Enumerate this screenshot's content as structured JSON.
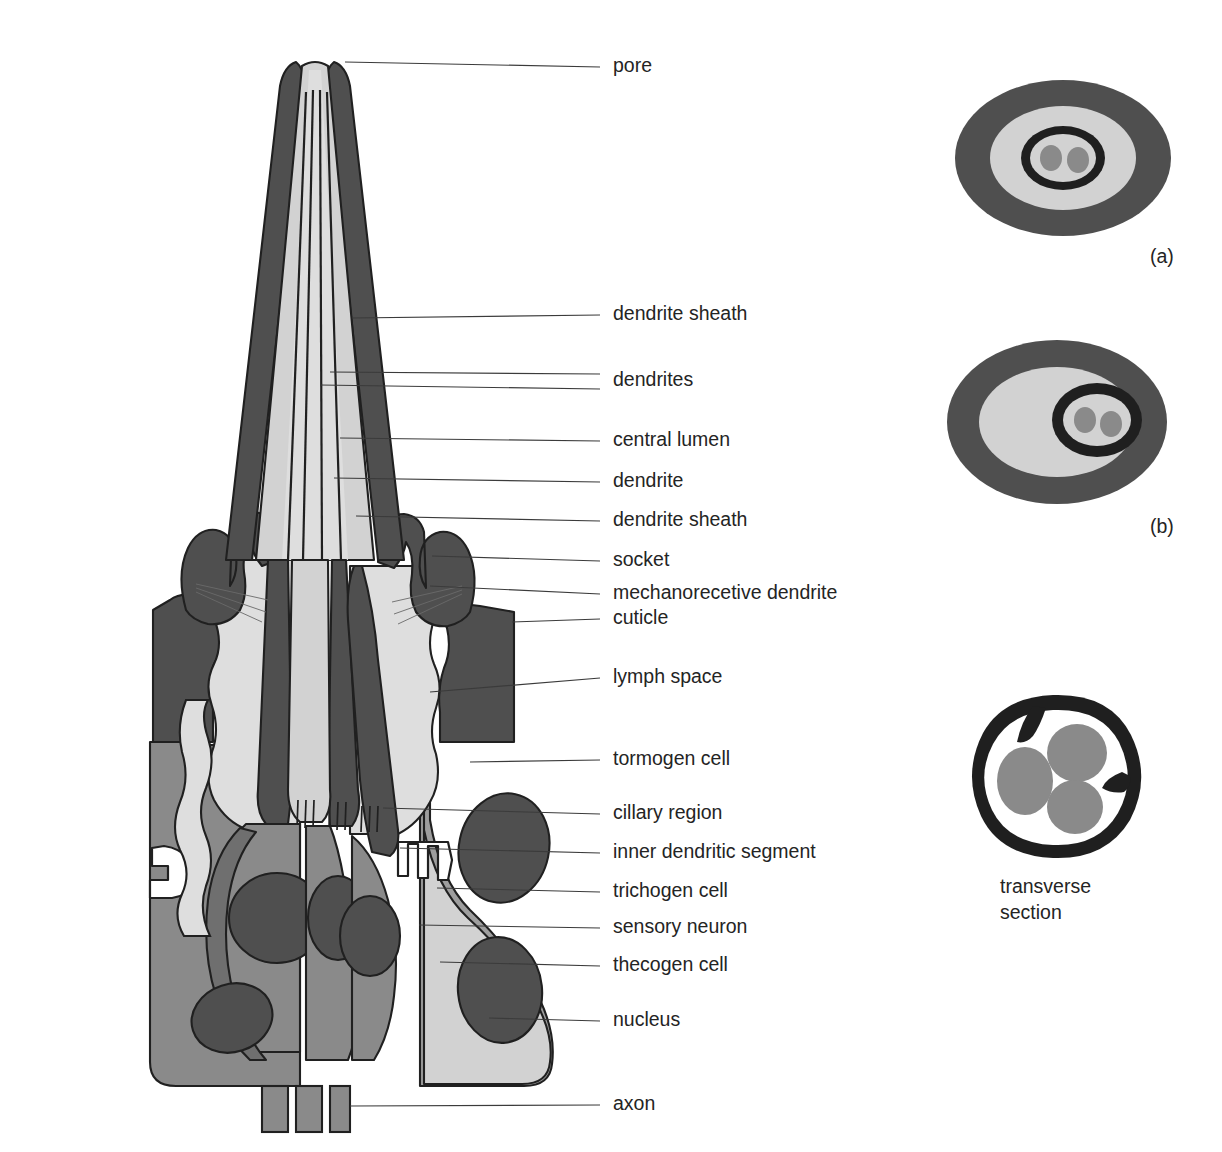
{
  "figure": {
    "type": "diagram",
    "background": "#ffffff"
  },
  "palette": {
    "outline": "#202020",
    "dark": "#4f4f4f",
    "dark_strong": "#454545",
    "mid": "#8a8a8a",
    "mid_light": "#9e9e9e",
    "light": "#d2d2d2",
    "lighter": "#dedede",
    "white": "#ffffff",
    "nucleus": "#6b6b6b",
    "text": "#242424",
    "leader": "#3b3b3b"
  },
  "labels": {
    "pore": "pore",
    "dendrite_sheath_1": "dendrite sheath",
    "dendrites": "dendrites",
    "central_lumen": "central lumen",
    "dendrite": "dendrite",
    "dendrite_sheath_2": "dendrite sheath",
    "socket": "socket",
    "mechanoreceptive_dendrite": "mechanorecetive dendrite",
    "cuticle": "cuticle",
    "lymph_space": "lymph space",
    "tormogen_cell": "tormogen cell",
    "cillary_region": "cillary region",
    "inner_dendritic_segment": "inner dendritic segment",
    "trichogen_cell": "trichogen cell",
    "sensory_neuron": "sensory neuron",
    "thecogen_cell": "thecogen cell",
    "nucleus": "nucleus",
    "axon": "axon"
  },
  "label_positions": [
    {
      "key": "pore",
      "text": "pore",
      "x": 613,
      "y": 67,
      "leader_x1": 345,
      "leader_y1": 62,
      "leader_x2": 600,
      "leader_y2": 67
    },
    {
      "key": "dendrite_sheath_1",
      "text": "dendrite sheath",
      "x": 613,
      "y": 315,
      "leader_x1": 352,
      "leader_y1": 318,
      "leader_x2": 600,
      "leader_y2": 315
    },
    {
      "key": "dendrites",
      "text": "dendrites",
      "x": 613,
      "y": 381,
      "leader_x1": 330,
      "leader_y1": 372,
      "leader_x2": 600,
      "leader_y2": 374
    },
    {
      "key": "dendrites_2",
      "text": "",
      "x": 613,
      "y": 389,
      "leader_x1": 320,
      "leader_y1": 385,
      "leader_x2": 600,
      "leader_y2": 389
    },
    {
      "key": "central_lumen",
      "text": "central lumen",
      "x": 613,
      "y": 441,
      "leader_x1": 340,
      "leader_y1": 438,
      "leader_x2": 600,
      "leader_y2": 441
    },
    {
      "key": "dendrite",
      "text": "dendrite",
      "x": 613,
      "y": 482,
      "leader_x1": 334,
      "leader_y1": 478,
      "leader_x2": 600,
      "leader_y2": 482
    },
    {
      "key": "dendrite_sheath_2",
      "text": "dendrite sheath",
      "x": 613,
      "y": 521,
      "leader_x1": 356,
      "leader_y1": 516,
      "leader_x2": 600,
      "leader_y2": 521
    },
    {
      "key": "socket",
      "text": "socket",
      "x": 613,
      "y": 561,
      "leader_x1": 432,
      "leader_y1": 556,
      "leader_x2": 600,
      "leader_y2": 561
    },
    {
      "key": "mechanoreceptive_dendrite",
      "text": "mechanorecetive dendrite",
      "x": 613,
      "y": 594,
      "leader_x1": 430,
      "leader_y1": 586,
      "leader_x2": 600,
      "leader_y2": 594
    },
    {
      "key": "cuticle",
      "text": "cuticle",
      "x": 613,
      "y": 619,
      "leader_x1": 512,
      "leader_y1": 622,
      "leader_x2": 600,
      "leader_y2": 619
    },
    {
      "key": "lymph_space",
      "text": "lymph space",
      "x": 613,
      "y": 678,
      "leader_x1": 430,
      "leader_y1": 692,
      "leader_x2": 600,
      "leader_y2": 678
    },
    {
      "key": "tormogen_cell",
      "text": "tormogen cell",
      "x": 613,
      "y": 760,
      "leader_x1": 470,
      "leader_y1": 762,
      "leader_x2": 600,
      "leader_y2": 760
    },
    {
      "key": "cillary_region",
      "text": "cillary region",
      "x": 613,
      "y": 814,
      "leader_x1": 383,
      "leader_y1": 808,
      "leader_x2": 600,
      "leader_y2": 814
    },
    {
      "key": "inner_dendritic_segment",
      "text": "inner dendritic segment",
      "x": 613,
      "y": 853,
      "leader_x1": 400,
      "leader_y1": 848,
      "leader_x2": 600,
      "leader_y2": 853
    },
    {
      "key": "trichogen_cell",
      "text": "trichogen cell",
      "x": 613,
      "y": 892,
      "leader_x1": 437,
      "leader_y1": 888,
      "leader_x2": 600,
      "leader_y2": 892
    },
    {
      "key": "sensory_neuron",
      "text": "sensory neuron",
      "x": 613,
      "y": 928,
      "leader_x1": 419,
      "leader_y1": 925,
      "leader_x2": 600,
      "leader_y2": 928
    },
    {
      "key": "thecogen_cell",
      "text": "thecogen cell",
      "x": 613,
      "y": 966,
      "leader_x1": 440,
      "leader_y1": 962,
      "leader_x2": 600,
      "leader_y2": 966
    },
    {
      "key": "nucleus",
      "text": "nucleus",
      "x": 613,
      "y": 1021,
      "leader_x1": 489,
      "leader_y1": 1018,
      "leader_x2": 600,
      "leader_y2": 1021
    },
    {
      "key": "axon",
      "text": "axon",
      "x": 613,
      "y": 1105,
      "leader_x1": 350,
      "leader_y1": 1106,
      "leader_x2": 600,
      "leader_y2": 1105
    }
  ],
  "insets": {
    "a": {
      "caption": "(a)",
      "caption_x": 1150,
      "caption_y": 258,
      "cx": 1063,
      "cy": 158,
      "rings": [
        {
          "name": "outer-cuticle-ring",
          "rx": 108,
          "ry": 78,
          "fill": "#4f4f4f"
        },
        {
          "name": "lymph-ring",
          "rx": 73,
          "ry": 52,
          "fill": "#d2d2d2"
        },
        {
          "name": "dendrite-sheath-ring",
          "rx": 42,
          "ry": 32,
          "fill": "#1f1f1f"
        },
        {
          "name": "central-lumen",
          "rx": 33,
          "ry": 24,
          "fill": "#d2d2d2"
        }
      ],
      "dendrites": [
        {
          "cx": -12,
          "cy": 0,
          "rx": 11,
          "ry": 13,
          "fill": "#8a8a8a"
        },
        {
          "cx": 15,
          "cy": 2,
          "rx": 11,
          "ry": 13,
          "fill": "#8a8a8a"
        }
      ]
    },
    "b": {
      "caption": "(b)",
      "caption_x": 1150,
      "caption_y": 528,
      "cx": 1057,
      "cy": 422,
      "rings": [
        {
          "name": "outer-cuticle-ring",
          "rx": 110,
          "ry": 82,
          "fill": "#4f4f4f"
        },
        {
          "name": "lymph-ring",
          "rx": 78,
          "ry": 55,
          "fill": "#d2d2d2"
        },
        {
          "name": "dendrite-sheath-ring",
          "rx": 45,
          "ry": 37,
          "fill": "#1f1f1f",
          "offset_x": 40,
          "offset_y": -2
        },
        {
          "name": "central-lumen",
          "rx": 34,
          "ry": 26,
          "fill": "#d2d2d2",
          "offset_x": 40,
          "offset_y": -2
        }
      ],
      "dendrites": [
        {
          "cx": 28,
          "cy": -2,
          "rx": 11,
          "ry": 13,
          "fill": "#8a8a8a"
        },
        {
          "cx": 54,
          "cy": 2,
          "rx": 11,
          "ry": 13,
          "fill": "#8a8a8a"
        }
      ]
    },
    "transverse": {
      "caption_line1": "transverse",
      "caption_line2": "section",
      "caption_x": 1053,
      "caption_y1": 888,
      "caption_y2": 914,
      "cx": 1053,
      "cy": 775,
      "outer_fill": "#1f1f1f",
      "inner_fill": "#ffffff",
      "dendrite_fill": "#8a8a8a",
      "dendrites": [
        {
          "cx": -28,
          "cy": 6,
          "rx": 28,
          "ry": 34
        },
        {
          "cx": 24,
          "cy": -22,
          "rx": 30,
          "ry": 29
        },
        {
          "cx": 22,
          "cy": 32,
          "rx": 28,
          "ry": 27
        }
      ]
    }
  }
}
